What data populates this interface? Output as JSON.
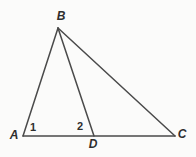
{
  "figure": {
    "background": "#fbfbfa",
    "stroke_color": "#4a4a4a",
    "label_color": "#2e2e2e",
    "vertices": [
      {
        "label": "A",
        "x": 23,
        "y": 136,
        "label_x": 14,
        "label_y": 135
      },
      {
        "label": "B",
        "x": 58,
        "y": 28,
        "label_x": 61,
        "label_y": 16
      },
      {
        "label": "C",
        "x": 175,
        "y": 136,
        "label_x": 182,
        "label_y": 134
      },
      {
        "label": "D",
        "x": 94,
        "y": 136,
        "label_x": 93,
        "label_y": 144
      }
    ],
    "segments": [
      {
        "from": "A",
        "to": "B"
      },
      {
        "from": "B",
        "to": "C"
      },
      {
        "from": "A",
        "to": "C"
      },
      {
        "from": "B",
        "to": "D"
      }
    ],
    "angle_labels": [
      {
        "label": "1",
        "x": 33,
        "y": 127
      },
      {
        "label": "2",
        "x": 80,
        "y": 126
      }
    ]
  }
}
